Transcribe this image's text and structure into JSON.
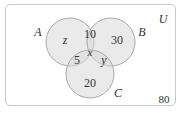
{
  "diagram": {
    "type": "venn",
    "universe": {
      "label": "U",
      "outside_value": "80"
    },
    "sets": [
      {
        "label": "A",
        "cx": 70,
        "cy": 42,
        "r": 24
      },
      {
        "label": "B",
        "cx": 111,
        "cy": 42,
        "r": 24
      },
      {
        "label": "C",
        "cx": 90,
        "cy": 74,
        "r": 24
      }
    ],
    "regions": {
      "A_only": "z",
      "B_only": "30",
      "C_only": "20",
      "A_and_B_only": "10",
      "A_and_C_only": "5",
      "B_and_C_only": "y",
      "A_and_B_and_C": "x"
    },
    "colors": {
      "circle_fill": "#e2e2e2",
      "circle_stroke": "#a9a9a9",
      "frame_stroke": "#c8c8c8",
      "text": "#333333"
    }
  }
}
